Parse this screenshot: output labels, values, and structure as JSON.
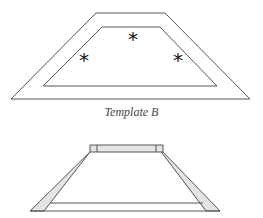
{
  "diagram": {
    "template_b": {
      "caption": "Template B",
      "outer_trapezoid": [
        [
          96,
          13
        ],
        [
          165,
          13
        ],
        [
          250,
          99
        ],
        [
          11,
          99
        ]
      ],
      "inner_trapezoid": [
        [
          102,
          27
        ],
        [
          160,
          27
        ],
        [
          217,
          86
        ],
        [
          43,
          86
        ]
      ],
      "markers": [
        {
          "symbol": "*",
          "x": 133,
          "y": 38
        },
        {
          "symbol": "*",
          "x": 84,
          "y": 59
        },
        {
          "symbol": "*",
          "x": 178,
          "y": 59
        }
      ]
    },
    "frame_assembly": {
      "top_bar": [
        [
          97,
          145
        ],
        [
          156,
          145
        ],
        [
          163,
          152
        ],
        [
          90,
          152
        ]
      ],
      "left_bar": [
        [
          97,
          145
        ],
        [
          90,
          152
        ],
        [
          44,
          211
        ],
        [
          30,
          211
        ]
      ],
      "right_bar": [
        [
          156,
          145
        ],
        [
          163,
          152
        ],
        [
          220,
          211
        ],
        [
          206,
          211
        ]
      ],
      "base_line": {
        "x1": 44,
        "x2": 206,
        "y": 203
      }
    },
    "colors": {
      "stroke": "#555555",
      "fill": "#e4e4e4",
      "background": "#ffffff"
    }
  }
}
